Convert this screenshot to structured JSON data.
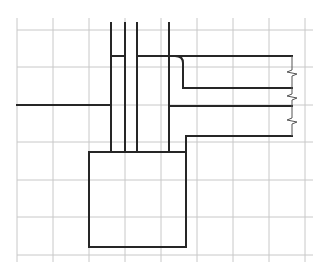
{
  "diagram": {
    "background": "#ffffff",
    "grid_color": "#c8c8c8",
    "ink_color": "#262626",
    "grid": {
      "x": [
        17,
        53,
        89,
        125,
        161,
        197,
        233,
        269,
        305
      ],
      "y": [
        30,
        67,
        105,
        142,
        180,
        217,
        255
      ],
      "x_extent": [
        17,
        305
      ],
      "y_extent": [
        18,
        262
      ]
    },
    "vertical_lines": [
      {
        "x": 111,
        "y1": 23,
        "y2": 152
      },
      {
        "x": 125,
        "y1": 23,
        "y2": 152
      },
      {
        "x": 137,
        "y1": 23,
        "y2": 152
      },
      {
        "x": 169,
        "y1": 23,
        "y2": 152
      }
    ],
    "left_horizontal": {
      "x1": 17,
      "x2": 111,
      "y": 105
    },
    "short_bridge": {
      "x1": 111,
      "x2": 125,
      "y": 56
    },
    "box": {
      "x": 89,
      "y": 152,
      "width": 97,
      "height": 95
    },
    "right_breaks": [
      {
        "y": 73
      },
      {
        "y": 97
      },
      {
        "y": 121
      }
    ]
  }
}
